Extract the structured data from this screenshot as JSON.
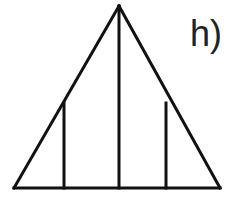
{
  "figure": {
    "label": "h)",
    "caption_position": "top-right",
    "background_color": "#ffffff",
    "stroke_color": "#111111",
    "stroke_width": 3,
    "canvas": {
      "width": 235,
      "height": 199
    },
    "shape": {
      "type": "triangle",
      "apex": {
        "x": 119,
        "y": 6
      },
      "base_left": {
        "x": 14,
        "y": 188
      },
      "base_right": {
        "x": 220,
        "y": 188
      }
    },
    "outline_segments": [
      {
        "name": "left-edge",
        "x1": 14,
        "y1": 188,
        "x2": 119,
        "y2": 6
      },
      {
        "name": "right-edge",
        "x1": 119,
        "y1": 6,
        "x2": 220,
        "y2": 188
      },
      {
        "name": "base-edge",
        "x1": 14,
        "y1": 188,
        "x2": 220,
        "y2": 188
      }
    ],
    "interior_verticals": [
      {
        "name": "left-vertical",
        "x": 64,
        "y_top": 103,
        "y_bottom": 188
      },
      {
        "name": "center-vertical",
        "x": 119,
        "y_top": 6,
        "y_bottom": 188
      },
      {
        "name": "right-vertical",
        "x": 166,
        "y_top": 103,
        "y_bottom": 188
      }
    ],
    "region_count": 4
  }
}
